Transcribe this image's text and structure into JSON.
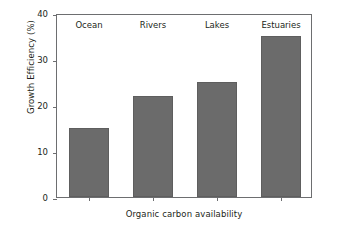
{
  "chart_data": {
    "type": "bar",
    "title": "",
    "subtitle": "",
    "categories": [
      "Ocean",
      "Rivers",
      "Lakes",
      "Estuaries"
    ],
    "values": [
      15,
      22,
      25,
      35
    ],
    "xlabel": "Organic carbon availability",
    "ylabel": "Growth Efficiency (%)",
    "ylim": [
      0,
      40
    ],
    "yticks": [
      0,
      10,
      20,
      30,
      40
    ],
    "ytick_labels": [
      "0",
      "10",
      "20",
      "30",
      "40"
    ],
    "xtick_labels": [
      "",
      "",
      "",
      ""
    ],
    "grid": false,
    "legend": null,
    "annotations": [],
    "category_label_position": "top-inside-axes",
    "colors": {
      "bar_fill": "#6b6b6b",
      "bar_edge": "#5e5e5e",
      "axis": "#6d6e70",
      "text": "#231f20",
      "background": "#ffffff"
    }
  }
}
